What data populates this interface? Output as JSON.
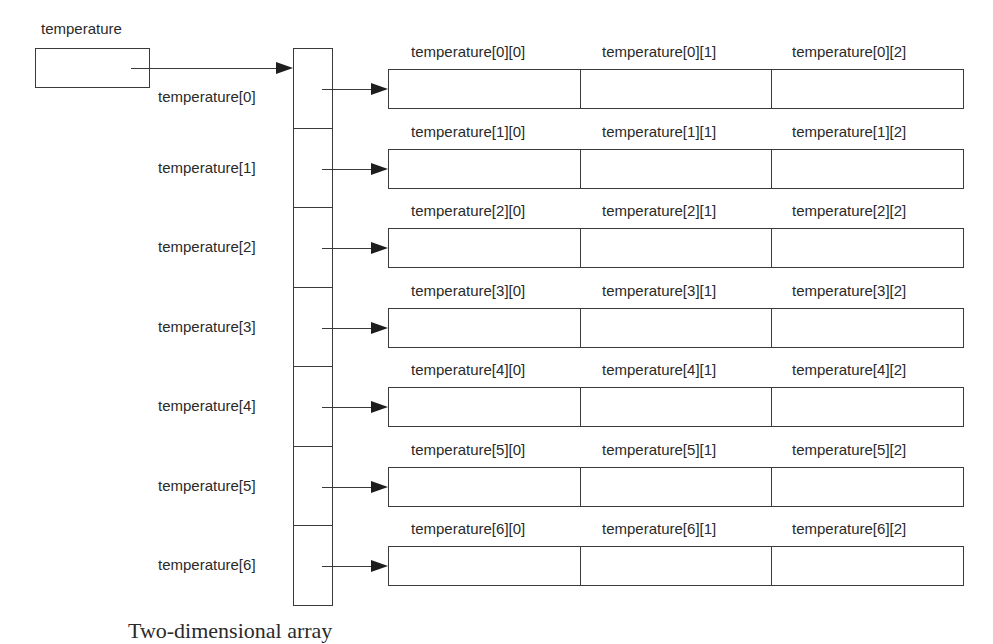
{
  "diagram": {
    "type": "two-dimensional-array-memory-layout",
    "pointer_variable": {
      "label": "temperature"
    },
    "row_pointer_labels": [
      "temperature[0]",
      "temperature[1]",
      "temperature[2]",
      "temperature[3]",
      "temperature[4]",
      "temperature[5]",
      "temperature[6]"
    ],
    "rows": [
      {
        "cells": [
          "temperature[0][0]",
          "temperature[0][1]",
          "temperature[0][2]"
        ]
      },
      {
        "cells": [
          "temperature[1][0]",
          "temperature[1][1]",
          "temperature[1][2]"
        ]
      },
      {
        "cells": [
          "temperature[2][0]",
          "temperature[2][1]",
          "temperature[2][2]"
        ]
      },
      {
        "cells": [
          "temperature[3][0]",
          "temperature[3][1]",
          "temperature[3][2]"
        ]
      },
      {
        "cells": [
          "temperature[4][0]",
          "temperature[4][1]",
          "temperature[4][2]"
        ]
      },
      {
        "cells": [
          "temperature[5][0]",
          "temperature[5][1]",
          "temperature[5][2]"
        ]
      },
      {
        "cells": [
          "temperature[6][0]",
          "temperature[6][1]",
          "temperature[6][2]"
        ]
      }
    ],
    "caption_fragment": "Two-dimensional array"
  }
}
